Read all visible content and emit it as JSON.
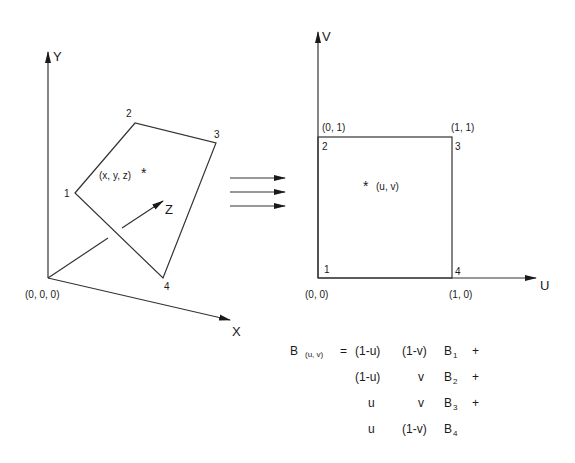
{
  "left_panel": {
    "axes": {
      "y_label": "Y",
      "x_label": "X",
      "z_label": "Z"
    },
    "origin_label": "(0, 0, 0)",
    "vertices": [
      {
        "id": "1",
        "label": "1"
      },
      {
        "id": "2",
        "label": "2"
      },
      {
        "id": "3",
        "label": "3"
      },
      {
        "id": "4",
        "label": "4"
      }
    ],
    "point_label": "(x, y, z)",
    "point_marker": "*"
  },
  "mapping_arrows": {
    "count": 3,
    "meaning": "maps to"
  },
  "right_panel": {
    "axes": {
      "v_label": "V",
      "u_label": "U"
    },
    "corners": {
      "bottom_left": "(0, 0)",
      "top_left": "(0, 1)",
      "top_right": "(1, 1)",
      "bottom_right": "(1, 0)"
    },
    "vertices": [
      {
        "id": "1",
        "label": "1"
      },
      {
        "id": "2",
        "label": "2"
      },
      {
        "id": "3",
        "label": "3"
      },
      {
        "id": "4",
        "label": "4"
      }
    ],
    "point_label": "(u, v)",
    "point_marker": "*"
  },
  "equation": {
    "lhs": "B",
    "lhs_sub": "(u, v)",
    "equals": "=",
    "rows": [
      {
        "a": "(1-u)",
        "b": "(1-v)",
        "term": "B",
        "sub": "1",
        "op": "+"
      },
      {
        "a": "(1-u)",
        "b": "v",
        "term": "B",
        "sub": "2",
        "op": "+"
      },
      {
        "a": "u",
        "b": "v",
        "term": "B",
        "sub": "3",
        "op": "+"
      },
      {
        "a": "u",
        "b": "(1-v)",
        "term": "B",
        "sub": "4",
        "op": ""
      }
    ]
  }
}
